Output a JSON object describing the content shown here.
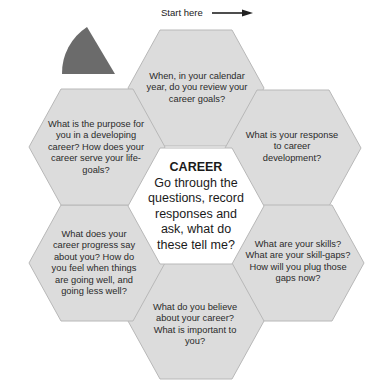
{
  "start_label": "Start here",
  "colors": {
    "hex_fill": "#dcdcdc",
    "hex_stroke": "#b8b8b8",
    "center_fill": "#ffffff",
    "marker_fill": "#6b6b6b"
  },
  "center": {
    "title": "CAREER",
    "lines": [
      "Go through the",
      "questions, record",
      "responses and",
      "ask, what do",
      "these tell me?"
    ]
  },
  "hexagons": [
    {
      "id": "top",
      "lines": [
        "When, in your calendar",
        "year, do you review your",
        "career goals?"
      ]
    },
    {
      "id": "right-upper",
      "lines": [
        "What is your response",
        "to career",
        "development?"
      ]
    },
    {
      "id": "right-lower",
      "lines": [
        "What are your skills?",
        "What are your skill-gaps?",
        "How will you plug those",
        "gaps now?"
      ]
    },
    {
      "id": "bottom",
      "lines": [
        "What do you believe",
        "about your career?",
        "What is important to",
        "you?"
      ]
    },
    {
      "id": "left-lower",
      "lines": [
        "What does your",
        "career progress say",
        "about you? How do",
        "you feel when things",
        "are going well, and",
        "going less well?"
      ]
    },
    {
      "id": "left-upper",
      "lines": [
        "What is the purpose for",
        "you in a developing",
        "career? How does your",
        "career serve your life-",
        "goals?"
      ]
    }
  ]
}
